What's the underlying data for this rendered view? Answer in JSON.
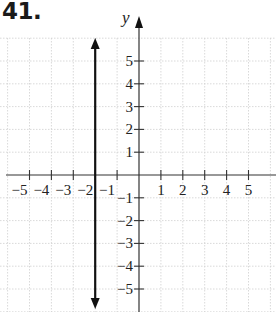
{
  "problem": {
    "number": "41."
  },
  "chart_data": {
    "type": "line",
    "title": "41.",
    "xlabel": "",
    "ylabel": "y",
    "xlim": [
      -5.5,
      5.8
    ],
    "ylim": [
      -6,
      6.8
    ],
    "grid": true,
    "x_ticks": [
      -5,
      -4,
      -3,
      -2,
      -1,
      1,
      2,
      3,
      4,
      5
    ],
    "x_tick_labels": [
      "−5",
      "−4",
      "−3",
      "−2",
      "−1",
      "1",
      "2",
      "3",
      "4",
      "5"
    ],
    "y_ticks": [
      5,
      4,
      3,
      2,
      1,
      -1,
      -2,
      -3,
      -4,
      -5
    ],
    "y_tick_labels": [
      "5",
      "4",
      "3",
      "2",
      "1",
      "−1",
      "−2",
      "−3",
      "−4",
      "−5"
    ],
    "series": [
      {
        "name": "x = -2",
        "kind": "vertical_line",
        "x": [
          -2,
          -2
        ],
        "y": [
          6.1,
          -5.8
        ],
        "arrows": "both",
        "color": "#111111"
      }
    ]
  },
  "colors": {
    "axis": "#333333",
    "grid": "#cfcfcf",
    "line": "#111111"
  }
}
